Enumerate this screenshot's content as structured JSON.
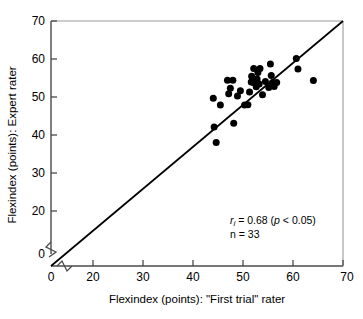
{
  "chart_data": {
    "type": "scatter",
    "title": "",
    "xlabel": "Flexindex (points): \"First trial\" rater",
    "ylabel": "Flexindex (points):  Expert rater",
    "xlim": [
      0,
      70
    ],
    "ylim": [
      0,
      70
    ],
    "xticks": [
      0,
      20,
      30,
      40,
      50,
      60,
      70
    ],
    "yticks": [
      0,
      20,
      30,
      40,
      50,
      60,
      70
    ],
    "xtick_labels": [
      "0",
      "20",
      "30",
      "40",
      "50",
      "60",
      "70"
    ],
    "ytick_labels": [
      "0",
      "20",
      "30",
      "40",
      "50",
      "60",
      "70"
    ],
    "grid": false,
    "axis_break": true,
    "axis_break_note": "zigzag break on both axes between 0 and 20",
    "legend": "none",
    "marker_color": "#000000",
    "marker_style": "filled-circle",
    "reference_line": {
      "label": "line of identity",
      "from": [
        0,
        0
      ],
      "to": [
        70,
        70
      ],
      "color": "#000000"
    },
    "annotations": [
      {
        "text": "r",
        "subscript": "i",
        "rest": " = 0.68 (",
        "italic_p": "p",
        "tail": " < 0.05)"
      },
      {
        "text": "n = 33"
      }
    ],
    "annotation_lines": [
      "r_i = 0.68 (p < 0.05)",
      "n = 33"
    ],
    "n": 33,
    "correlation": 0.68,
    "p_value_text": "p < 0.05",
    "points": [
      {
        "x": 38.9,
        "y": 47.9
      },
      {
        "x": 39.1,
        "y": 39.7
      },
      {
        "x": 39.6,
        "y": 35.3
      },
      {
        "x": 40.6,
        "y": 46.0
      },
      {
        "x": 42.3,
        "y": 53.1
      },
      {
        "x": 42.6,
        "y": 49.2
      },
      {
        "x": 43.0,
        "y": 50.8
      },
      {
        "x": 43.6,
        "y": 53.1
      },
      {
        "x": 43.8,
        "y": 40.8
      },
      {
        "x": 44.7,
        "y": 48.6
      },
      {
        "x": 45.4,
        "y": 50.1
      },
      {
        "x": 46.4,
        "y": 46.0
      },
      {
        "x": 47.2,
        "y": 46.1
      },
      {
        "x": 47.6,
        "y": 49.7
      },
      {
        "x": 48.0,
        "y": 52.6
      },
      {
        "x": 48.1,
        "y": 54.2
      },
      {
        "x": 48.5,
        "y": 52.4
      },
      {
        "x": 48.6,
        "y": 56.4
      },
      {
        "x": 49.2,
        "y": 51.2
      },
      {
        "x": 49.4,
        "y": 53.4
      },
      {
        "x": 49.6,
        "y": 55.3
      },
      {
        "x": 49.9,
        "y": 52.0
      },
      {
        "x": 50.1,
        "y": 56.4
      },
      {
        "x": 50.7,
        "y": 48.9
      },
      {
        "x": 51.4,
        "y": 52.7
      },
      {
        "x": 52.2,
        "y": 51.0
      },
      {
        "x": 52.6,
        "y": 57.7
      },
      {
        "x": 52.8,
        "y": 54.4
      },
      {
        "x": 53.1,
        "y": 52.4
      },
      {
        "x": 53.5,
        "y": 51.3
      },
      {
        "x": 54.1,
        "y": 52.4
      },
      {
        "x": 58.8,
        "y": 59.3
      },
      {
        "x": 59.2,
        "y": 56.3
      },
      {
        "x": 62.9,
        "y": 53.0
      }
    ]
  },
  "figure": {
    "x_axis_label": "Flexindex (points): \"First trial\" rater",
    "y_axis_label_part1": "Flexindex (points):",
    "y_axis_label_part2": "Expert rater",
    "y_axis_label_full": "Flexindex (points):  Expert rater",
    "annotation_r": "r",
    "annotation_r_sub": "i",
    "annotation_r_rest": " = 0.68 (",
    "annotation_p": "p",
    "annotation_p_rest": " < 0.05)",
    "annotation_n": "n = 33",
    "tick_0": "0",
    "tick_20": "20",
    "tick_30": "30",
    "tick_40": "40",
    "tick_50": "50",
    "tick_60": "60",
    "tick_70": "70"
  }
}
